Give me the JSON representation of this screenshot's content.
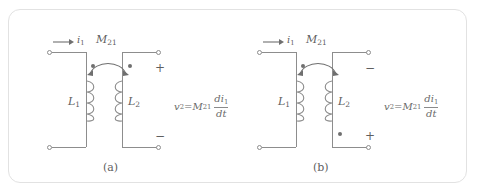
{
  "figure": {
    "type": "mutual-inductance-circuit-pair",
    "frame_border_color": "#e2e2e2",
    "wire_color": "#8d8d8d",
    "text_color": "#5f5f5f"
  },
  "panels": [
    {
      "id": "a",
      "caption": "(a)",
      "current_label": "i",
      "current_sub": "1",
      "mutual_label": "M",
      "mutual_sub": "21",
      "primary_inductor": "L",
      "primary_sub": "1",
      "secondary_inductor": "L",
      "secondary_sub": "2",
      "top_polarity": "+",
      "bottom_polarity": "−",
      "primary_dot_position": "top",
      "secondary_dot_position": "top",
      "equation": {
        "lhs": "v",
        "lhs_sub": "2",
        "equals": "=",
        "coefficient": "M",
        "coefficient_sub": "21",
        "fraction_numerator": "di",
        "fraction_numerator_sub": "1",
        "fraction_denominator": "dt",
        "plain": "v2 = M21 di1/dt"
      }
    },
    {
      "id": "b",
      "caption": "(b)",
      "current_label": "i",
      "current_sub": "1",
      "mutual_label": "M",
      "mutual_sub": "21",
      "primary_inductor": "L",
      "primary_sub": "1",
      "secondary_inductor": "L",
      "secondary_sub": "2",
      "top_polarity": "−",
      "bottom_polarity": "+",
      "primary_dot_position": "top",
      "secondary_dot_position": "bottom",
      "equation": {
        "lhs": "v",
        "lhs_sub": "2",
        "equals": "=",
        "coefficient": "M",
        "coefficient_sub": "21",
        "fraction_numerator": "di",
        "fraction_numerator_sub": "1",
        "fraction_denominator": "dt",
        "plain": "v2 = M21 di1/dt"
      }
    }
  ],
  "icons": {
    "current_arrow": "right-arrow-icon",
    "coupling_arc": "double-headed-arc-icon",
    "coil": "inductor-coil-icon",
    "terminal": "open-terminal-icon",
    "polarity_dot": "polarity-dot-icon"
  }
}
